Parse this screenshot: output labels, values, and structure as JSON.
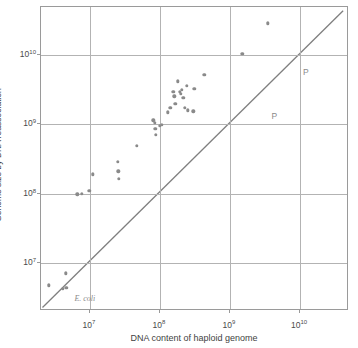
{
  "chart_data": {
    "type": "scatter",
    "title": "",
    "xlabel": "DNA content of haploid genome",
    "ylabel": "Genome size by DNA reassociation",
    "xscale": "log",
    "yscale": "log",
    "xlim": [
      2000000,
      50000000000
    ],
    "ylim": [
      2000000,
      50000000000
    ],
    "grid": true,
    "legend": "none",
    "xticks": [
      {
        "value": 10000000,
        "label": "10",
        "exponent": "7"
      },
      {
        "value": 100000000,
        "label": "10",
        "exponent": "8"
      },
      {
        "value": 1000000000,
        "label": "10",
        "exponent": "9"
      },
      {
        "value": 10000000000,
        "label": "10",
        "exponent": "10"
      }
    ],
    "yticks": [
      {
        "value": 10000000,
        "label": "10",
        "exponent": "7"
      },
      {
        "value": 100000000,
        "label": "10",
        "exponent": "8"
      },
      {
        "value": 1000000000,
        "label": "10",
        "exponent": "9"
      },
      {
        "value": 10000000000,
        "label": "10",
        "exponent": "10"
      }
    ],
    "reference_line": {
      "name": "one-to-one-line",
      "description": "y = x diagonal",
      "slope": 1,
      "from": [
        2100000,
        2100000
      ],
      "to": [
        44000000000,
        44000000000
      ],
      "color": "#7f7f7f"
    },
    "point_color": "#8a8a8a",
    "points": [
      {
        "x": 2600000,
        "y": 4700000
      },
      {
        "x": 4100000,
        "y": 4200000
      },
      {
        "x": 4500000,
        "y": 7000000
      },
      {
        "x": 4600000,
        "y": 4300000
      },
      {
        "x": 6600000,
        "y": 98000000
      },
      {
        "x": 7600000,
        "y": 100000000
      },
      {
        "x": 9800000,
        "y": 110000000
      },
      {
        "x": 11000000,
        "y": 190000000
      },
      {
        "x": 25000000,
        "y": 290000000
      },
      {
        "x": 25500000,
        "y": 210000000
      },
      {
        "x": 26000000,
        "y": 165000000
      },
      {
        "x": 47000000,
        "y": 490000000
      },
      {
        "x": 80000000,
        "y": 1150000000
      },
      {
        "x": 85000000,
        "y": 1050000000
      },
      {
        "x": 86000000,
        "y": 860000000
      },
      {
        "x": 88000000,
        "y": 700000000
      },
      {
        "x": 100000000,
        "y": 960000000
      },
      {
        "x": 105000000,
        "y": 980000000
      },
      {
        "x": 130000000,
        "y": 1500000000
      },
      {
        "x": 140000000,
        "y": 1750000000
      },
      {
        "x": 155000000,
        "y": 3000000000
      },
      {
        "x": 160000000,
        "y": 2550000000
      },
      {
        "x": 165000000,
        "y": 2000000000
      },
      {
        "x": 180000000,
        "y": 4200000000
      },
      {
        "x": 190000000,
        "y": 3000000000
      },
      {
        "x": 200000000,
        "y": 2800000000
      },
      {
        "x": 205000000,
        "y": 3200000000
      },
      {
        "x": 215000000,
        "y": 2450000000
      },
      {
        "x": 225000000,
        "y": 1750000000
      },
      {
        "x": 240000000,
        "y": 3600000000
      },
      {
        "x": 250000000,
        "y": 1600000000
      },
      {
        "x": 300000000,
        "y": 1550000000
      },
      {
        "x": 310000000,
        "y": 3300000000
      },
      {
        "x": 430000000,
        "y": 5200000000
      },
      {
        "x": 1500000000,
        "y": 10500000000
      },
      {
        "x": 3500000000,
        "y": 29000000000
      }
    ],
    "annotations": [
      {
        "name": "e-coli-label",
        "text": "E. coli",
        "x": 6000000,
        "y": 3500000,
        "style": "italic-serif"
      },
      {
        "name": "p-label-upper",
        "text": "P",
        "x": 11000000000,
        "y": 6800000000,
        "style": "plain"
      },
      {
        "name": "p-label-lower",
        "text": "P",
        "x": 3900000000,
        "y": 1550000000,
        "style": "plain"
      }
    ]
  }
}
